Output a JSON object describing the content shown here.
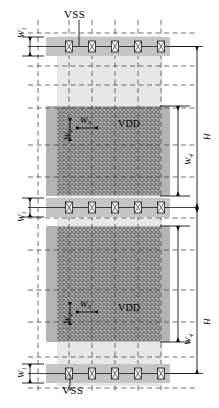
{
  "figure": {
    "kind": "power-distribution-network-layout",
    "caption": "",
    "net_labels": {
      "vss_top": "VSS",
      "vss_bottom": "VSS",
      "vdd_upper": "VDD",
      "vdd_lower": "VDD"
    },
    "dimensions": [
      {
        "id": "w1-top",
        "symbol": "W",
        "subscript": "1",
        "orientation": "vertical",
        "measures": "VSS rail band width (top)"
      },
      {
        "id": "w1-mid",
        "symbol": "W",
        "subscript": "1",
        "orientation": "vertical",
        "measures": "VSS rail band width (middle)"
      },
      {
        "id": "w1-bottom",
        "symbol": "W",
        "subscript": "1",
        "orientation": "vertical",
        "measures": "VSS rail band width (bottom)"
      },
      {
        "id": "w2-upper",
        "symbol": "W",
        "subscript": "2",
        "orientation": "vertical",
        "measures": "VDD mesh horizontal stripe width (upper block)"
      },
      {
        "id": "w2-lower",
        "symbol": "W",
        "subscript": "2",
        "orientation": "vertical",
        "measures": "VDD mesh horizontal stripe width (lower block)"
      },
      {
        "id": "w3-upper",
        "symbol": "W",
        "subscript": "3",
        "orientation": "horizontal",
        "measures": "VDD mesh pitch (upper block)"
      },
      {
        "id": "w3-lower",
        "symbol": "W",
        "subscript": "3",
        "orientation": "horizontal",
        "measures": "VDD mesh pitch (lower block)"
      },
      {
        "id": "w4-upper",
        "symbol": "W",
        "subscript": "4",
        "orientation": "vertical",
        "measures": "VDD mesh block height (upper)"
      },
      {
        "id": "w4-lower",
        "symbol": "W",
        "subscript": "4",
        "orientation": "vertical",
        "measures": "VDD mesh block height (lower)"
      },
      {
        "id": "h-upper",
        "symbol": "H",
        "subscript": "",
        "orientation": "vertical",
        "measures": "tile height (upper)"
      },
      {
        "id": "h-lower",
        "symbol": "H",
        "subscript": "",
        "orientation": "vertical",
        "measures": "tile height (lower)"
      }
    ],
    "grid": {
      "vertical_gridlines": 5,
      "horizontal_gridlines": 8,
      "style": "dashed"
    },
    "rails": [
      {
        "id": "vss-rail-top",
        "net": "VSS",
        "cell_count": 5
      },
      {
        "id": "vss-rail-middle",
        "net": "VSS",
        "cell_count": 5
      },
      {
        "id": "vss-rail-bottom",
        "net": "VSS",
        "cell_count": 5
      }
    ],
    "mesh_blocks": [
      {
        "id": "vdd-mesh-upper",
        "net": "VDD",
        "fill": "cross-hatch"
      },
      {
        "id": "vdd-mesh-lower",
        "net": "VDD",
        "fill": "cross-hatch"
      }
    ],
    "colors": {
      "light_band": "#e6e6e6",
      "rail_band": "#c9c9c9",
      "mesh_band": "#b9b9b9",
      "mesh_hatch": "#8f8f8f",
      "line": "#1a1a1a",
      "dash": "#4d4d4d"
    }
  }
}
